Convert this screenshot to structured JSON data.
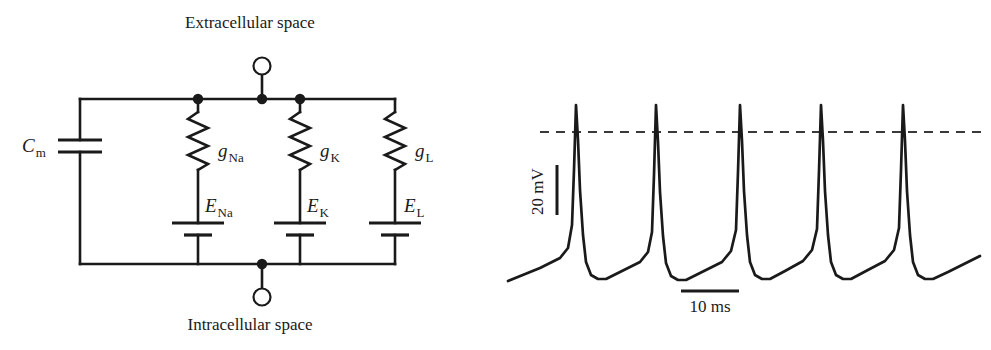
{
  "figure": {
    "title_top": "Extracellular space",
    "title_bottom": "Intracellular space",
    "ink_color": "#1a1a1a",
    "background_color": "#ffffff"
  },
  "circuit": {
    "caption_top": "Extracellular space",
    "caption_bottom": "Intracellular space",
    "capacitor": {
      "symbol": "C",
      "subscript": "m",
      "name": "membrane-capacitance"
    },
    "branches": [
      {
        "conductance_symbol": "g",
        "conductance_subscript": "Na",
        "battery_symbol": "E",
        "battery_subscript": "Na",
        "name": "sodium-branch"
      },
      {
        "conductance_symbol": "g",
        "conductance_subscript": "K",
        "battery_symbol": "E",
        "battery_subscript": "K",
        "name": "potassium-branch"
      },
      {
        "conductance_symbol": "g",
        "conductance_subscript": "L",
        "battery_symbol": "E",
        "battery_subscript": "L",
        "name": "leak-branch"
      }
    ],
    "terminals": [
      {
        "name": "extracellular-terminal",
        "position": "top"
      },
      {
        "name": "intracellular-terminal",
        "position": "bottom"
      }
    ]
  },
  "trace": {
    "voltage_scalebar_label": "20 mV",
    "time_scalebar_label": "10 ms",
    "threshold_line_style": "dashed",
    "spike_count": 5
  },
  "chart_data": {
    "type": "line",
    "title": "",
    "xlabel": "",
    "ylabel": "",
    "x_scalebar": {
      "label": "10 ms",
      "value": 10,
      "unit": "ms"
    },
    "y_scalebar": {
      "label": "20 mV",
      "value": 20,
      "unit": "mV"
    },
    "threshold": {
      "shown": true,
      "style": "dashed",
      "y_px": 132
    },
    "spike_peaks_x_px": [
      576,
      656,
      740,
      821,
      903
    ],
    "spike_peak_y_px": 105,
    "trough_y_px": 279,
    "baseline_start_y_px": 281,
    "series": [
      {
        "name": "membrane-potential",
        "points_px": [
          [
            508,
            281
          ],
          [
            540,
            268
          ],
          [
            560,
            258
          ],
          [
            568,
            248
          ],
          [
            572,
            225
          ],
          [
            574,
            170
          ],
          [
            576,
            105
          ],
          [
            578,
            140
          ],
          [
            580,
            190
          ],
          [
            583,
            235
          ],
          [
            586,
            262
          ],
          [
            591,
            275
          ],
          [
            598,
            279
          ],
          [
            606,
            279
          ],
          [
            620,
            272
          ],
          [
            640,
            262
          ],
          [
            648,
            252
          ],
          [
            652,
            232
          ],
          [
            654,
            175
          ],
          [
            656,
            105
          ],
          [
            658,
            142
          ],
          [
            660,
            192
          ],
          [
            663,
            236
          ],
          [
            666,
            263
          ],
          [
            671,
            276
          ],
          [
            678,
            280
          ],
          [
            686,
            280
          ],
          [
            702,
            272
          ],
          [
            722,
            262
          ],
          [
            731,
            251
          ],
          [
            736,
            230
          ],
          [
            738,
            172
          ],
          [
            740,
            105
          ],
          [
            742,
            141
          ],
          [
            744,
            191
          ],
          [
            747,
            235
          ],
          [
            750,
            262
          ],
          [
            755,
            275
          ],
          [
            762,
            279
          ],
          [
            770,
            279
          ],
          [
            785,
            271
          ],
          [
            803,
            261
          ],
          [
            812,
            250
          ],
          [
            817,
            229
          ],
          [
            819,
            171
          ],
          [
            821,
            105
          ],
          [
            823,
            141
          ],
          [
            825,
            191
          ],
          [
            828,
            235
          ],
          [
            831,
            262
          ],
          [
            836,
            275
          ],
          [
            843,
            279
          ],
          [
            851,
            279
          ],
          [
            866,
            271
          ],
          [
            885,
            261
          ],
          [
            894,
            250
          ],
          [
            899,
            228
          ],
          [
            901,
            170
          ],
          [
            903,
            105
          ],
          [
            905,
            141
          ],
          [
            907,
            191
          ],
          [
            910,
            235
          ],
          [
            913,
            262
          ],
          [
            918,
            275
          ],
          [
            925,
            279
          ],
          [
            933,
            279
          ],
          [
            948,
            272
          ],
          [
            968,
            262
          ],
          [
            980,
            256
          ]
        ]
      }
    ],
    "legend": {
      "shown": false
    },
    "grid": false
  }
}
